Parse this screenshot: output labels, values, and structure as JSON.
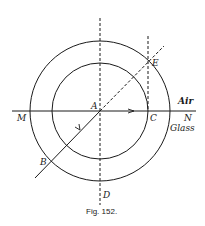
{
  "figure": {
    "caption": "Fig. 152.",
    "labels": {
      "M": "M",
      "A": "A",
      "C": "C",
      "N": "N",
      "E": "E",
      "B": "B",
      "D": "D",
      "air": "Air",
      "glass": "Glass"
    },
    "geometry": {
      "center": [
        100,
        111
      ],
      "outer_radius": 70,
      "inner_radius": 48,
      "interface_y": 111
    },
    "colors": {
      "ink": "#1a1a1a",
      "background": "#ffffff"
    }
  }
}
